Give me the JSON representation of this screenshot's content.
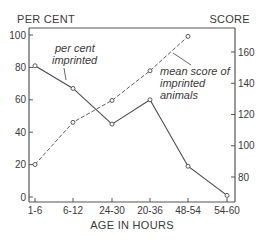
{
  "chart_data": {
    "type": "line",
    "title": "",
    "xlabel": "AGE IN HOURS",
    "ylabel_left": "PER CENT",
    "ylabel_right": "SCORE",
    "categories": [
      "1-6",
      "6-12",
      "24-30",
      "20-36",
      "48-54",
      "54-60"
    ],
    "ylim_left": [
      0,
      100
    ],
    "ylim_right": [
      70,
      180
    ],
    "yticks_left": [
      0,
      20,
      40,
      60,
      80,
      100
    ],
    "yticks_right": [
      80,
      100,
      120,
      140,
      160
    ],
    "grid": false,
    "legend": "inline annotations",
    "series": [
      {
        "name": "per cent imprinted",
        "axis": "left",
        "style": "solid",
        "values": [
          81,
          67,
          45,
          60,
          19,
          1
        ]
      },
      {
        "name": "mean score of imprinted animals",
        "axis": "right",
        "style": "dashed",
        "values": [
          88,
          115,
          129,
          148,
          170,
          null
        ]
      }
    ],
    "annotations": [
      {
        "text_lines": [
          "per cent",
          "imprinted"
        ],
        "series": "per cent imprinted"
      },
      {
        "text_lines": [
          "mean score of",
          "imprinted",
          "animals"
        ],
        "series": "mean score of imprinted animals"
      }
    ]
  },
  "colors": {
    "line": "#4a4a4a",
    "text": "#3a3a3a",
    "background": "#ffffff"
  }
}
